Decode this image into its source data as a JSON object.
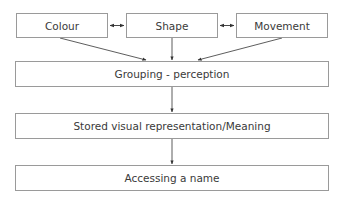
{
  "diagram": {
    "type": "flowchart",
    "top_row": [
      {
        "id": "colour",
        "label": "Colour"
      },
      {
        "id": "shape",
        "label": "Shape"
      },
      {
        "id": "movement",
        "label": "Movement"
      }
    ],
    "stages": [
      {
        "id": "grouping",
        "label": "Grouping - perception"
      },
      {
        "id": "stored",
        "label": "Stored visual representation/Meaning"
      },
      {
        "id": "access",
        "label": "Accessing a name"
      }
    ],
    "edges": [
      {
        "from": "colour",
        "to": "shape",
        "style": "bidirectional"
      },
      {
        "from": "shape",
        "to": "movement",
        "style": "bidirectional"
      },
      {
        "from": "colour",
        "to": "grouping",
        "style": "arrow"
      },
      {
        "from": "shape",
        "to": "grouping",
        "style": "arrow"
      },
      {
        "from": "movement",
        "to": "grouping",
        "style": "arrow"
      },
      {
        "from": "grouping",
        "to": "stored",
        "style": "arrow"
      },
      {
        "from": "stored",
        "to": "access",
        "style": "arrow"
      }
    ],
    "colors": {
      "box_border": "#9a9a9a",
      "text": "#3a3a3a",
      "arrow": "#333333",
      "background": "#ffffff"
    }
  }
}
